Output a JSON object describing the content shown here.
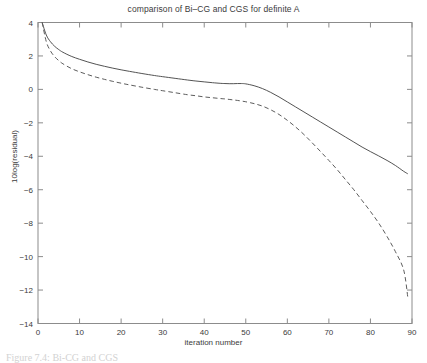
{
  "figure": {
    "caption_fragment": "Figure 7.4: Bi-CG and CGS",
    "ylabel": "10log(residual)",
    "xlabel": "iteration number"
  },
  "chart_data": {
    "type": "line",
    "title": "comparison of Bi–CG and CGS for definite A",
    "xlabel": "iteration number",
    "ylabel": "10log(residual)",
    "xlim": [
      0,
      90
    ],
    "ylim": [
      -14,
      4
    ],
    "xticks": [
      0,
      10,
      20,
      30,
      40,
      50,
      60,
      70,
      80,
      90
    ],
    "yticks": [
      4,
      2,
      0,
      -2,
      -4,
      -6,
      -8,
      -10,
      -12,
      -14
    ],
    "grid": false,
    "legend": null,
    "x": [
      1,
      2,
      3,
      4,
      5,
      6,
      8,
      10,
      12,
      14,
      16,
      18,
      20,
      22,
      25,
      28,
      30,
      33,
      36,
      38,
      40,
      42,
      44,
      45,
      46,
      47,
      48,
      49,
      50,
      52,
      54,
      56,
      58,
      60,
      62,
      64,
      66,
      68,
      70,
      72,
      74,
      76,
      78,
      80,
      82,
      84,
      86,
      88,
      89
    ],
    "series": [
      {
        "name": "Bi-CG",
        "style": "solid",
        "color": "#404040",
        "values": [
          4.0,
          3.25,
          2.85,
          2.58,
          2.38,
          2.22,
          1.98,
          1.8,
          1.64,
          1.5,
          1.38,
          1.27,
          1.17,
          1.08,
          0.95,
          0.83,
          0.76,
          0.66,
          0.56,
          0.5,
          0.45,
          0.4,
          0.36,
          0.35,
          0.34,
          0.34,
          0.35,
          0.35,
          0.33,
          0.22,
          0.05,
          -0.18,
          -0.45,
          -0.75,
          -1.05,
          -1.35,
          -1.65,
          -1.95,
          -2.25,
          -2.55,
          -2.85,
          -3.15,
          -3.45,
          -3.72,
          -3.98,
          -4.25,
          -4.55,
          -4.9,
          -5.05
        ]
      },
      {
        "name": "CGS",
        "style": "dashed",
        "color": "#4a4a4a",
        "values": [
          4.0,
          2.85,
          2.3,
          1.96,
          1.72,
          1.53,
          1.25,
          1.05,
          0.88,
          0.73,
          0.6,
          0.48,
          0.37,
          0.27,
          0.13,
          0.0,
          -0.08,
          -0.2,
          -0.32,
          -0.38,
          -0.45,
          -0.5,
          -0.55,
          -0.57,
          -0.6,
          -0.63,
          -0.66,
          -0.7,
          -0.74,
          -0.85,
          -1.0,
          -1.22,
          -1.5,
          -1.85,
          -2.25,
          -2.7,
          -3.2,
          -3.72,
          -4.25,
          -4.8,
          -5.4,
          -6.0,
          -6.65,
          -7.3,
          -8.0,
          -8.8,
          -9.7,
          -10.8,
          -12.45
        ]
      }
    ]
  }
}
